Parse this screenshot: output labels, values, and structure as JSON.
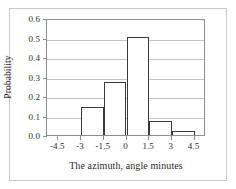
{
  "chart_data": {
    "type": "bar",
    "title": "",
    "xlabel": "The azimuth, angle minutes",
    "ylabel": "Probability",
    "categories": [
      "-4.5 to -3",
      "-3 to -1.5",
      "-1.5 to 0",
      "0 to 1.5",
      "1.5 to 3",
      "3 to 4.5"
    ],
    "bin_edges": [
      -4.5,
      -3,
      -1.5,
      0,
      1.5,
      3,
      4.5
    ],
    "values": [
      0,
      0.145,
      0.27,
      0.505,
      0.07,
      0.02
    ],
    "xlim": [
      -5.25,
      5.25
    ],
    "ylim": [
      0,
      0.6
    ],
    "xticks": [
      "-4.5",
      "-3",
      "-1.5",
      "0",
      "1.5",
      "3",
      "4.5"
    ],
    "xtick_values": [
      -4.5,
      -3,
      -1.5,
      0,
      1.5,
      3,
      4.5
    ],
    "yticks": [
      "0.0",
      "0.1",
      "0.2",
      "0.3",
      "0.4",
      "0.5",
      "0.6"
    ],
    "ytick_values": [
      0.0,
      0.1,
      0.2,
      0.3,
      0.4,
      0.5,
      0.6
    ],
    "grid": "horizontal",
    "legend": "none",
    "bar_fill": "#ffffff",
    "bar_edge": "#3a3a3a",
    "gridline_color": "#c4c4c4",
    "axis_color": "#8d8d8d"
  }
}
